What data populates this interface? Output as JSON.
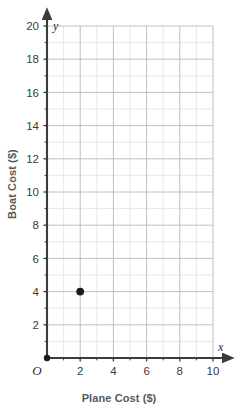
{
  "chart_data": {
    "type": "scatter",
    "title": "",
    "xlabel": "Plane Cost ($)",
    "ylabel": "Boat Cost ($)",
    "x_axis_variable": "x",
    "y_axis_variable": "y",
    "origin_label": "O",
    "xlim": [
      0,
      10
    ],
    "ylim": [
      0,
      20
    ],
    "x_major_step": 2,
    "y_major_step": 2,
    "x_minor_step": 1,
    "y_minor_step": 1,
    "xticks": [
      2,
      4,
      6,
      8,
      10
    ],
    "yticks": [
      2,
      4,
      6,
      8,
      10,
      12,
      14,
      16,
      18,
      20
    ],
    "xtick_labels": [
      "2",
      "4",
      "6",
      "8",
      "10"
    ],
    "ytick_labels": [
      "2",
      "4",
      "6",
      "8",
      "10",
      "12",
      "14",
      "16",
      "18",
      "20"
    ],
    "grid": true,
    "legend": false,
    "points": [
      {
        "x": 2,
        "y": 4,
        "label": "(2, 4)"
      }
    ],
    "origin_point": {
      "x": 0,
      "y": 0
    },
    "colors": {
      "point": "#1a1a1a",
      "axis": "#3b3b3b",
      "grid_major": "#b9b9bd",
      "grid_minor": "#dedee2",
      "tick_text": "#3b3b3b",
      "axis_title": "#58595b",
      "background": "#ffffff"
    }
  }
}
